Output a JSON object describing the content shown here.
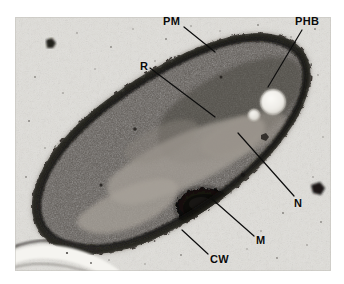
{
  "figure": {
    "kind": "transmission-electron-micrograph",
    "background_color": "#ffffff",
    "plate_color": "#dcdad6"
  },
  "micrograph": {
    "frame": {
      "x": 15,
      "y": 17,
      "width": 316,
      "height": 254
    },
    "cell": {
      "name": "rod-shaped bacterium",
      "orientation": "diagonal, lower-left to upper-right",
      "cytoplasm_color": "#55504b",
      "wall_color": "#2a2724"
    },
    "granules": [
      {
        "name": "phb-granule-large",
        "cx": 258,
        "cy": 85,
        "r": 12,
        "color": "#efeeea"
      },
      {
        "name": "phb-granule-small",
        "cx": 239,
        "cy": 98,
        "r": 5.5,
        "color": "#eae9e4"
      }
    ],
    "mesosome": {
      "name": "mesosome",
      "cx": 190,
      "cy": 191,
      "color": "#13110f"
    },
    "nucleoid_color": "#a9a49d",
    "debris": [
      {
        "cx": 50,
        "cy": 42,
        "r": 3
      },
      {
        "cx": 315,
        "cy": 189,
        "r": 4
      }
    ],
    "fold": {
      "name": "section-fold",
      "color": "#f4f3ef"
    }
  },
  "labels": [
    {
      "id": "PM",
      "text": "PM",
      "name": "label-plasma-membrane",
      "x": 163,
      "y": 16,
      "leader": {
        "x1": 184,
        "y1": 27,
        "x2": 215,
        "y2": 52
      }
    },
    {
      "id": "PHB",
      "text": "PHB",
      "name": "label-phb-granule",
      "x": 295,
      "y": 16,
      "leader": {
        "x1": 302,
        "y1": 30,
        "x2": 268,
        "y2": 87
      }
    },
    {
      "id": "R",
      "text": "R",
      "name": "label-ribosomes",
      "x": 140,
      "y": 61,
      "leader": {
        "x1": 150,
        "y1": 68,
        "x2": 215,
        "y2": 117
      }
    },
    {
      "id": "N",
      "text": "N",
      "name": "label-nucleoid",
      "x": 294,
      "y": 198,
      "leader": {
        "x1": 294,
        "y1": 196,
        "x2": 238,
        "y2": 133
      }
    },
    {
      "id": "M",
      "text": "M",
      "name": "label-mesosome",
      "x": 256,
      "y": 235,
      "leader": {
        "x1": 254,
        "y1": 236,
        "x2": 212,
        "y2": 199
      }
    },
    {
      "id": "CW",
      "text": "CW",
      "name": "label-cell-wall",
      "x": 210,
      "y": 254,
      "leader": {
        "x1": 208,
        "y1": 254,
        "x2": 182,
        "y2": 230
      }
    }
  ],
  "leader_line": {
    "color": "#0d0d0d",
    "width": 1.2
  }
}
